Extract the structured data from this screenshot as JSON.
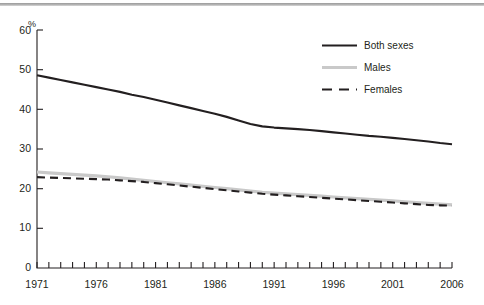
{
  "chart_data": {
    "type": "line",
    "title": "",
    "subtitle": "",
    "xlabel": "",
    "ylabel": "%",
    "xlim": [
      1971,
      2006
    ],
    "ylim": [
      0,
      60
    ],
    "ytick_step": 10,
    "yticks": [
      "0",
      "10",
      "20",
      "30",
      "40",
      "50",
      "60"
    ],
    "xticks_labeled": [
      "1971",
      "1976",
      "1981",
      "1986",
      "1991",
      "1996",
      "2001",
      "2006"
    ],
    "xtick_step_minor": 1,
    "grid": false,
    "legend_position": "top-right",
    "x": [
      1971,
      1972,
      1973,
      1974,
      1975,
      1976,
      1977,
      1978,
      1979,
      1980,
      1981,
      1982,
      1983,
      1984,
      1985,
      1986,
      1987,
      1988,
      1989,
      1990,
      1991,
      1992,
      1993,
      1994,
      1995,
      1996,
      1997,
      1998,
      1999,
      2000,
      2001,
      2002,
      2003,
      2004,
      2005,
      2006
    ],
    "series": [
      {
        "name": "Both sexes",
        "color": "#231f20",
        "style": "solid",
        "values": [
          48.6,
          48.0,
          47.4,
          46.8,
          46.2,
          45.6,
          45.0,
          44.4,
          43.7,
          43.1,
          42.4,
          41.7,
          41.0,
          40.3,
          39.6,
          38.9,
          38.1,
          37.2,
          36.3,
          35.7,
          35.4,
          35.2,
          35.0,
          34.8,
          34.5,
          34.2,
          33.9,
          33.6,
          33.3,
          33.1,
          32.8,
          32.5,
          32.2,
          31.9,
          31.5,
          31.2
        ]
      },
      {
        "name": "Males",
        "color": "#c9c9c9",
        "style": "solid",
        "values": [
          24.2,
          24.0,
          23.8,
          23.6,
          23.4,
          23.2,
          23.0,
          22.7,
          22.4,
          22.1,
          21.8,
          21.5,
          21.2,
          20.9,
          20.6,
          20.3,
          20.0,
          19.7,
          19.4,
          19.1,
          18.9,
          18.7,
          18.5,
          18.3,
          18.1,
          17.9,
          17.7,
          17.5,
          17.3,
          17.1,
          16.9,
          16.7,
          16.5,
          16.3,
          16.1,
          15.9
        ]
      },
      {
        "name": "Females",
        "color": "#231f20",
        "style": "dashed",
        "values": [
          22.9,
          22.8,
          22.7,
          22.6,
          22.5,
          22.4,
          22.3,
          22.1,
          21.9,
          21.7,
          21.4,
          21.1,
          20.8,
          20.5,
          20.2,
          19.9,
          19.6,
          19.3,
          19.0,
          18.7,
          18.5,
          18.3,
          18.1,
          17.9,
          17.7,
          17.5,
          17.3,
          17.1,
          16.9,
          16.7,
          16.5,
          16.3,
          16.1,
          15.9,
          15.8,
          15.7
        ]
      }
    ]
  },
  "legend": {
    "items": [
      {
        "label": "Both sexes"
      },
      {
        "label": "Males"
      },
      {
        "label": "Females"
      }
    ]
  },
  "colors": {
    "ink": "#231f20",
    "males_gray": "#c9c9c9",
    "top_rule": "#a8a8a8"
  }
}
